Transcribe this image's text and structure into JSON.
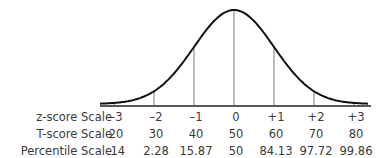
{
  "chart_data": {
    "type": "line",
    "title": "",
    "x": [
      -3,
      -2,
      -1,
      0,
      1,
      2,
      3
    ],
    "rows": [
      {
        "label": "z-score Scale",
        "values": [
          "–3",
          "–2",
          "–1",
          "0",
          "+1",
          "+2",
          "+3"
        ]
      },
      {
        "label": "T-score Scale",
        "values": [
          "20",
          "30",
          "40",
          "50",
          "60",
          "70",
          "80"
        ]
      },
      {
        "label": "Percentile Scale",
        "values": [
          ".14",
          "2.28",
          "15.87",
          "50",
          "84.13",
          "97.72",
          "99.86"
        ]
      }
    ],
    "xlim": [
      -3.4,
      3.4
    ],
    "grid": false,
    "legend": "none"
  }
}
